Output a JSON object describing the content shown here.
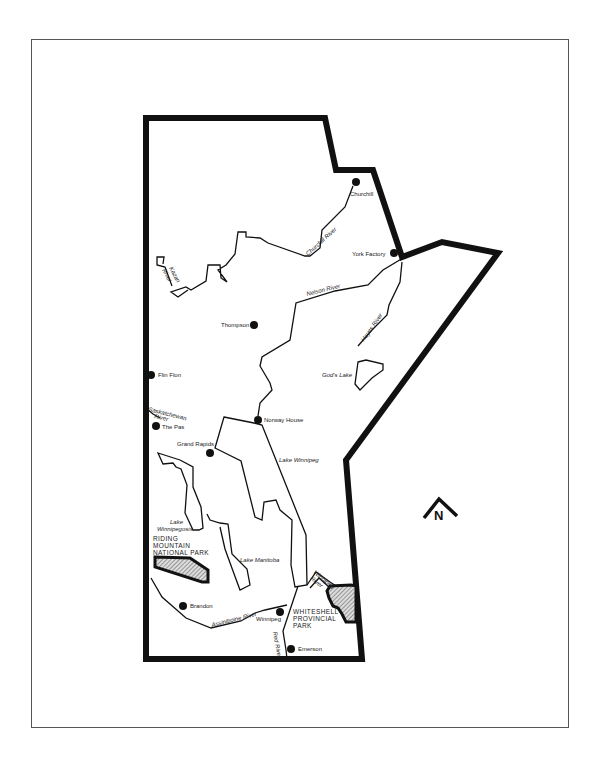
{
  "map": {
    "region": "Manitoba",
    "colors": {
      "border": "#111111",
      "line": "#111111",
      "background": "#ffffff",
      "park_hatch": "#999999"
    },
    "cities": [
      {
        "name": "Churchill",
        "x": 356,
        "y": 182
      },
      {
        "name": "York Factory",
        "x": 394,
        "y": 253
      },
      {
        "name": "Thompson",
        "x": 254,
        "y": 325
      },
      {
        "name": "Flin Flon",
        "x": 151,
        "y": 375
      },
      {
        "name": "The Pas",
        "x": 156,
        "y": 426
      },
      {
        "name": "Norway House",
        "x": 258,
        "y": 420
      },
      {
        "name": "Grand Rapids",
        "x": 210,
        "y": 453
      },
      {
        "name": "Brandon",
        "x": 183,
        "y": 606
      },
      {
        "name": "Winnipeg",
        "x": 280,
        "y": 612
      },
      {
        "name": "Emerson",
        "x": 291,
        "y": 649
      }
    ],
    "rivers": [
      {
        "name": "Churchill River"
      },
      {
        "name": "Kazan River"
      },
      {
        "name": "Nelson River"
      },
      {
        "name": "Hayes River"
      },
      {
        "name": "Saskatchewan River"
      },
      {
        "name": "Winnipeg River"
      },
      {
        "name": "Assiniboine River"
      },
      {
        "name": "Red River"
      }
    ],
    "lakes": [
      {
        "name": "God's Lake"
      },
      {
        "name": "Lake Winnipeg"
      },
      {
        "name": "Lake Winnipegosis"
      },
      {
        "name": "Lake Manitoba"
      }
    ],
    "parks": [
      {
        "name_lines": [
          "RIDING",
          "MOUNTAIN",
          "NATIONAL PARK"
        ]
      },
      {
        "name_lines": [
          "WHITESHELL",
          "PROVINCIAL",
          "PARK"
        ]
      }
    ],
    "labels": {
      "churchill": "Churchill",
      "york_factory": "York Factory",
      "thompson": "Thompson",
      "flin_flon": "Flin Flon",
      "the_pas": "The Pas",
      "norway_house": "Norway House",
      "grand_rapids": "Grand Rapids",
      "brandon": "Brandon",
      "winnipeg": "Winnipeg",
      "emerson": "Emerson",
      "churchill_river": "Churchill River",
      "kazan_river_1": "Kazan",
      "kazan_river_2": "River",
      "nelson_river": "Nelson River",
      "hayes_river": "Hayes River",
      "sask_river_1": "Saskatchewan",
      "sask_river_2": "River",
      "winnipeg_river_1": "Winnipeg",
      "winnipeg_river_2": "River",
      "assiniboine_river": "Assiniboine River",
      "red_river": "Red River",
      "gods_lake": "God's Lake",
      "lake_winnipeg": "Lake Winnipeg",
      "lake_winnipegosis_1": "Lake",
      "lake_winnipegosis_2": "Winnipegosis",
      "lake_manitoba": "Lake Manitoba",
      "riding_1": "RIDING",
      "riding_2": "MOUNTAIN",
      "riding_3": "NATIONAL PARK",
      "whiteshell_1": "WHITESHELL",
      "whiteshell_2": "PROVINCIAL",
      "whiteshell_3": "PARK",
      "north_letter": "N"
    }
  }
}
